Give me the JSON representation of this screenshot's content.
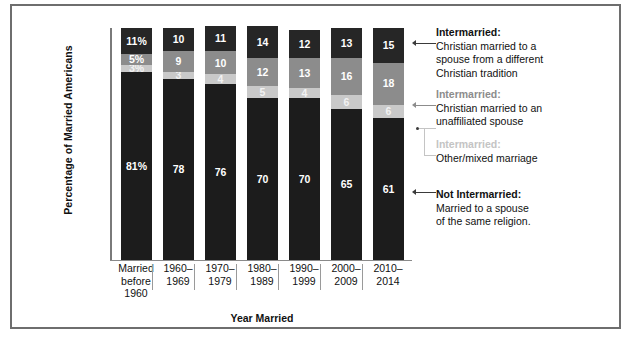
{
  "chart_data": {
    "type": "bar",
    "subtype": "stacked-bar-100",
    "title": "",
    "xlabel": "Year Married",
    "ylabel": "Percentage of Married Americans",
    "ylim": [
      0,
      100
    ],
    "grid": false,
    "legend_position": "right",
    "categories": [
      "Married before 1960",
      "1960–1969",
      "1970–1979",
      "1980–1989",
      "1990–1999",
      "2000–2009",
      "2010–2014"
    ],
    "series": [
      {
        "name": "Intermarried: Christian married to a spouse from a different Christian tradition",
        "color": "#262626",
        "values": [
          11,
          10,
          11,
          14,
          12,
          13,
          15
        ],
        "labels": [
          "11%",
          "10",
          "11",
          "14",
          "12",
          "13",
          "15"
        ]
      },
      {
        "name": "Intermarried: Christian married to an unaffiliated spouse",
        "color": "#8c8c8c",
        "values": [
          5,
          9,
          10,
          12,
          13,
          16,
          18
        ],
        "labels": [
          "5%",
          "9",
          "10",
          "12",
          "13",
          "16",
          "18"
        ]
      },
      {
        "name": "Intermarried: Other/mixed marriage",
        "color": "#c9c9c9",
        "values": [
          3,
          3,
          4,
          5,
          4,
          6,
          6
        ],
        "labels": [
          "3%",
          "3",
          "4",
          "5",
          "4",
          "6",
          "6"
        ]
      },
      {
        "name": "Not Intermarried: Married to a spouse of the same religion.",
        "color": "#1c1c1c",
        "values": [
          81,
          78,
          76,
          70,
          70,
          65,
          61
        ],
        "labels": [
          "81%",
          "78",
          "76",
          "70",
          "70",
          "65",
          "61"
        ]
      }
    ]
  },
  "axes": {
    "y_title": "Percentage of Married Americans",
    "x_title": "Year Married",
    "x_ticks": [
      {
        "line1": "Married",
        "line2": "before",
        "line3": "1960"
      },
      {
        "line1": "1960–",
        "line2": "1969",
        "line3": ""
      },
      {
        "line1": "1970–",
        "line2": "1979",
        "line3": ""
      },
      {
        "line1": "1980–",
        "line2": "1989",
        "line3": ""
      },
      {
        "line1": "1990–",
        "line2": "1999",
        "line3": ""
      },
      {
        "line1": "2000–",
        "line2": "2009",
        "line3": ""
      },
      {
        "line1": "2010–",
        "line2": "2014",
        "line3": ""
      }
    ]
  },
  "legend": {
    "items": [
      {
        "title": "Intermarried:",
        "tone": "dark",
        "lines": [
          "Christian married to a",
          "spouse from a different",
          "Christian tradition"
        ]
      },
      {
        "title": "Intermarried:",
        "tone": "mid",
        "lines": [
          "Christian married to an",
          "unaffiliated spouse"
        ]
      },
      {
        "title": "Intermarried:",
        "tone": "light",
        "lines": [
          "Other/mixed marriage"
        ]
      },
      {
        "title": "Not Intermarried:",
        "tone": "dark",
        "lines": [
          "Married to a spouse",
          "of the same religion."
        ]
      }
    ]
  },
  "colors": {
    "segment_christian_tradition": "#262626",
    "segment_unaffiliated": "#8c8c8c",
    "segment_other_mixed": "#c9c9c9",
    "segment_not_intermarried": "#1c1c1c",
    "frame": "#6e6e6e"
  }
}
